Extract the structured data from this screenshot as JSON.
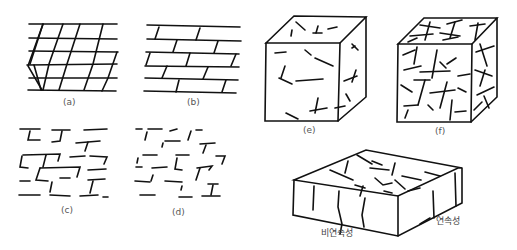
{
  "figure": {
    "panels": [
      {
        "id": "a",
        "label": "(a)",
        "description": "continuous orthogonal joint grid"
      },
      {
        "id": "b",
        "label": "(b)",
        "description": "continuous horizontal joints, staggered cross joints"
      },
      {
        "id": "c",
        "label": "(c)",
        "description": "discontinuous joints, staggered pattern"
      },
      {
        "id": "d",
        "label": "(d)",
        "description": "highly discontinuous scattered joints"
      },
      {
        "id": "e",
        "label": "(e)",
        "description": "cube with few scattered fractures"
      },
      {
        "id": "f",
        "label": "(f)",
        "description": "cube with dense fractures"
      }
    ],
    "block_diagram": {
      "labels": {
        "discontinuity": "비연속성",
        "continuity": "연속성"
      }
    }
  }
}
